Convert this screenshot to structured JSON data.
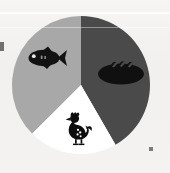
{
  "figure": {
    "background_color": "#f2f1ef",
    "medium": "scanned printed illustration"
  },
  "chart_data": {
    "type": "pie",
    "title": "",
    "xlabel": "",
    "ylabel": "",
    "legend_position": "none",
    "grid": false,
    "labels_shown": false,
    "center": {
      "cx": 81,
      "cy": 85,
      "r": 69
    },
    "categories": [
      "Fish",
      "Bread",
      "Chicken"
    ],
    "values": [
      37.5,
      41.7,
      20.8
    ],
    "units": "percent",
    "slices": [
      {
        "name": "Fish",
        "value": 37.5,
        "color": "#a8a8a8",
        "start_angle_deg": 225,
        "end_angle_deg": 360,
        "icon": "fish-icon",
        "icon_color": "#121212",
        "icon_x": 44,
        "icon_y": 58
      },
      {
        "name": "Bread",
        "value": 41.7,
        "color": "#4a4a4a",
        "start_angle_deg": 0,
        "end_angle_deg": 150,
        "icon": "bread-loaf-icon",
        "icon_color": "#101010",
        "icon_x": 121,
        "icon_y": 74
      },
      {
        "name": "Chicken",
        "value": 20.8,
        "color": "#ffffff",
        "start_angle_deg": 150,
        "end_angle_deg": 225,
        "icon": "chicken-hen-icon",
        "icon_color": "#0d0d0d",
        "icon_x": 76,
        "icon_y": 131
      }
    ],
    "colors": [
      "#a8a8a8",
      "#4a4a4a",
      "#ffffff"
    ]
  },
  "artifacts": {
    "scan_line_top_label": "horizontal scan streak",
    "edge_mark_left_label": "cropped ink fragment at left edge",
    "edge_mark_bottom_right_label": "ink speck near lower right"
  }
}
